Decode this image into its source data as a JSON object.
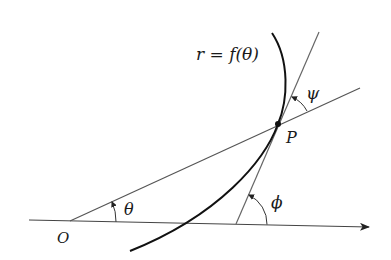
{
  "diagram": {
    "labels": {
      "curve": "r = f(θ)",
      "origin": "O",
      "point": "P",
      "theta": "θ",
      "phi": "ϕ",
      "psi": "ψ"
    },
    "colors": {
      "curve": "#111111",
      "lines": "#555555",
      "background": "#ffffff"
    }
  }
}
